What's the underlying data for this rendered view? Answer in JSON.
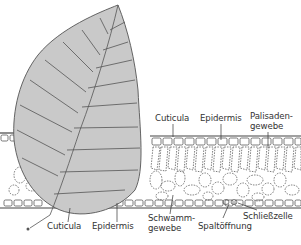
{
  "diagram": {
    "colors": {
      "leaf_fill": "#c9c9c9",
      "leaf_outline": "#555555",
      "cell_line": "#444444",
      "label_text": "#333333",
      "background": "#ffffff"
    },
    "labels": {
      "top_cuticula": "Cuticula",
      "top_epidermis": "Epidermis",
      "palisade_line1": "Palisaden-",
      "palisade_line2": "gewebe",
      "bottom_cuticula": "Cuticula",
      "bottom_epidermis": "Epidermis",
      "spongy_line1": "Schwamm-",
      "spongy_line2": "gewebe",
      "stoma": "Spaltöffnung",
      "guard_cell": "Schließzelle"
    }
  }
}
